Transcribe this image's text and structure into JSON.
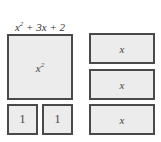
{
  "title": {
    "base": "x",
    "exp": "2",
    "rest": " + 3x + 2"
  },
  "tiles": {
    "big": {
      "base": "x",
      "exp": "2"
    },
    "unit_1": "1",
    "unit_2": "1",
    "bar_1": "x",
    "bar_2": "x",
    "bar_3": "x"
  },
  "colors": {
    "tile_fill": "#ececec",
    "tile_border": "#4a4a4a"
  }
}
